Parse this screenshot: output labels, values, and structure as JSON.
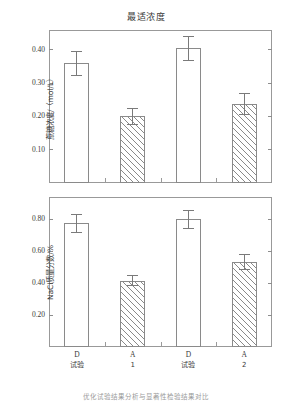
{
  "figure": {
    "title": "最适浓度",
    "caption_partial": "优化试验结果分析与显著性检验结果对比"
  },
  "axis": {
    "categories": [
      {
        "line1": "D",
        "line2": "试验"
      },
      {
        "line1": "A",
        "line2": "1"
      },
      {
        "line1": "D",
        "line2": "试验"
      },
      {
        "line1": "A",
        "line2": "2"
      }
    ]
  },
  "chart_data": [
    {
      "type": "bar",
      "title": "最适浓度",
      "panel": "top",
      "xlabel": "",
      "ylabel": "蔗糖浓度/（mol/L）",
      "categories": [
        "D",
        "A",
        "D",
        "A"
      ],
      "category_sublabels": [
        "试验",
        "1",
        "试验",
        "2"
      ],
      "values": [
        0.36,
        0.2,
        0.405,
        0.237
      ],
      "errors": [
        0.038,
        0.026,
        0.038,
        0.033
      ],
      "fills": [
        "open",
        "hatched",
        "open",
        "hatched"
      ],
      "ylim": [
        0,
        0.46
      ],
      "yticks": [
        0.1,
        0.2,
        0.3,
        0.4
      ],
      "ytick_labels": [
        "0.10",
        "0.20",
        "0.30",
        "0.40"
      ],
      "grid": false,
      "legend": "none"
    },
    {
      "type": "bar",
      "title": "",
      "panel": "bottom",
      "xlabel": "",
      "ylabel": "NaCl质量分数/%",
      "categories": [
        "D",
        "A",
        "D",
        "A"
      ],
      "category_sublabels": [
        "试验",
        "1",
        "试验",
        "2"
      ],
      "values": [
        0.775,
        0.415,
        0.8,
        0.53
      ],
      "errors": [
        0.06,
        0.035,
        0.06,
        0.05
      ],
      "fills": [
        "open",
        "hatched",
        "open",
        "hatched"
      ],
      "ylim": [
        0,
        0.94
      ],
      "yticks": [
        0.2,
        0.4,
        0.6,
        0.8
      ],
      "ytick_labels": [
        "0.20",
        "0.40",
        "0.60",
        "0.80"
      ],
      "grid": false,
      "legend": "none"
    }
  ]
}
